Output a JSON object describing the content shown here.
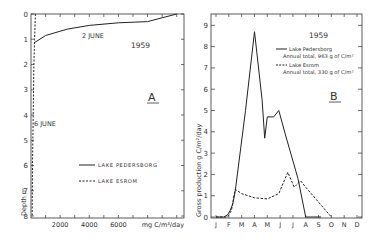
{
  "chart_data": [
    {
      "panel": "A",
      "type": "line",
      "title": "1959",
      "panel_label": "A",
      "xlabel": "mg C/m³/day",
      "ylabel": "Depth m",
      "x_ticks": [
        "2000",
        "4000",
        "6000"
      ],
      "y_ticks": [
        "0",
        "1",
        "2",
        "3",
        "4",
        "5",
        "6",
        "7",
        "8"
      ],
      "xlim": [
        0,
        10500
      ],
      "ylim": [
        8,
        0
      ],
      "annotations": [
        "2 JUNE",
        "6 JUNE"
      ],
      "legend": [
        "LAKE PEDERSBORG",
        "LAKE ESROM"
      ],
      "series": [
        {
          "name": "LAKE PEDERSBORG",
          "style": "solid",
          "date": "2 JUNE",
          "x": [
            10000,
            9000,
            8000,
            6000,
            4000,
            2500,
            1000,
            200
          ],
          "y": [
            0,
            0.15,
            0.3,
            0.35,
            0.45,
            0.6,
            0.85,
            1.15
          ]
        },
        {
          "name": "LAKE ESROM",
          "style": "dashed",
          "date": "6 JUNE",
          "x": [
            300,
            250,
            200,
            150,
            100,
            80
          ],
          "y": [
            0,
            1,
            2,
            4,
            6,
            8
          ]
        }
      ]
    },
    {
      "panel": "B",
      "type": "line",
      "title": "1959",
      "panel_label": "B",
      "xlabel": "",
      "ylabel": "Gross production g C/m²/day",
      "categories": [
        "J",
        "F",
        "M",
        "A",
        "M",
        "J",
        "J",
        "A",
        "S",
        "O",
        "N",
        "D"
      ],
      "y_ticks": [
        "0",
        "1",
        "2",
        "3",
        "4",
        "5",
        "6",
        "7",
        "8",
        "9"
      ],
      "ylim": [
        0,
        9.5
      ],
      "legend": [
        {
          "name": "Lake Pedersborg",
          "note": "Annual total, 963 g of C/m²"
        },
        {
          "name": "Lake Esrom",
          "note": "Annual total, 330 g of C/m²"
        }
      ],
      "series": [
        {
          "name": "Lake Pedersborg",
          "style": "solid",
          "x": [
            0.0,
            0.6,
            0.9,
            1.1,
            1.3,
            1.5,
            2.3,
            3.0,
            3.6,
            3.8,
            4.0,
            4.5,
            4.9,
            5.4,
            6.4,
            7.0,
            7.4,
            8.0,
            8.2
          ],
          "y": [
            0.0,
            0.0,
            0.1,
            0.3,
            0.6,
            1.2,
            5.0,
            8.7,
            5.5,
            3.7,
            4.7,
            4.7,
            5.0,
            3.9,
            1.8,
            0.0,
            0.0,
            0.0,
            0.0
          ]
        },
        {
          "name": "Lake Esrom",
          "style": "dashed",
          "x": [
            0.0,
            0.9,
            1.2,
            1.5,
            2.0,
            3.0,
            4.0,
            4.9,
            5.6,
            6.1,
            6.6,
            7.0,
            8.0,
            9.0
          ],
          "y": [
            0.0,
            0.0,
            0.3,
            1.3,
            1.1,
            0.9,
            0.85,
            1.1,
            2.1,
            1.4,
            1.7,
            1.4,
            0.7,
            0.0
          ]
        }
      ]
    }
  ]
}
